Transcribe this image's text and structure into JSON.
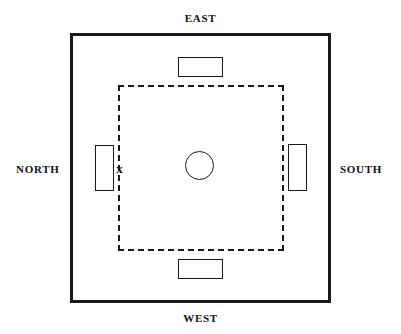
{
  "diagram": {
    "title_visible": false,
    "labels": {
      "east": "EAST",
      "west": "WEST",
      "north": "NORTH",
      "south": "SOUTH"
    },
    "markers": {
      "x_mark": "x"
    },
    "colors": {
      "stroke": "#1a1a1a",
      "background": "#ffffff",
      "text": "#111111"
    },
    "shapes": {
      "outer_boundary": {
        "type": "square",
        "stroke": "solid",
        "stroke_width_px": 3
      },
      "inner_boundary": {
        "type": "square",
        "stroke": "dashed",
        "stroke_width_px": 2
      },
      "center": {
        "type": "circle"
      },
      "rect_top": {
        "type": "rectangle",
        "orientation": "horizontal"
      },
      "rect_bottom": {
        "type": "rectangle",
        "orientation": "horizontal"
      },
      "rect_left": {
        "type": "rectangle",
        "orientation": "vertical"
      },
      "rect_right": {
        "type": "rectangle",
        "orientation": "vertical"
      }
    }
  }
}
